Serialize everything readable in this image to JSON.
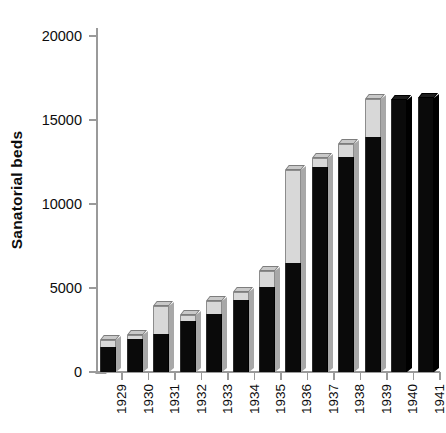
{
  "chart_data": {
    "type": "bar",
    "subtype": "stacked-bar-3d",
    "title": "",
    "xlabel": "",
    "ylabel": "Sanatorial beds",
    "ylim": [
      0,
      20000
    ],
    "yticks": [
      0,
      5000,
      10000,
      15000,
      20000
    ],
    "ytick_labels": [
      "0",
      "5000",
      "10000",
      "15000",
      "20000"
    ],
    "grid": false,
    "legend": "none",
    "categories": [
      "1929",
      "1930",
      "1931",
      "1932",
      "1933",
      "1934",
      "1935",
      "1936",
      "1937",
      "1938",
      "1939",
      "1940",
      "1941"
    ],
    "series": [
      {
        "name": "lower-segment",
        "color": "#0a0a0a",
        "values": [
          1490,
          1960,
          2260,
          3040,
          3450,
          4290,
          5070,
          6490,
          12200,
          12800,
          14000,
          16200,
          16300
        ]
      },
      {
        "name": "upper-segment",
        "color": "#d8d8d8",
        "values": [
          420,
          240,
          1680,
          330,
          800,
          480,
          950,
          5530,
          550,
          750,
          2260,
          0,
          0
        ]
      }
    ],
    "totals": [
      1910,
      2200,
      3940,
      3370,
      4250,
      4770,
      6020,
      12020,
      12750,
      13550,
      16260,
      16200,
      16300
    ]
  },
  "axis": {
    "y_title": "Sanatorial beds"
  }
}
